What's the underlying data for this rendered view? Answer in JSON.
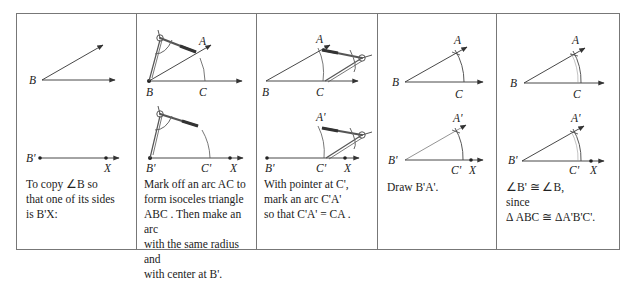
{
  "figure": {
    "panels": [
      {
        "id": "step-1",
        "caption_lines": [
          "To copy ∠B so",
          "that one of its sides",
          "is B'X:"
        ],
        "labels": {
          "B": "B",
          "B_prime": "B'",
          "X": "X"
        }
      },
      {
        "id": "step-2",
        "caption_lines": [
          "Mark off an arc AC to",
          "form isoceles triangle",
          "ABC . Then make an arc",
          "with the same radius and",
          "with center at B'."
        ],
        "labels": {
          "A": "A",
          "B": "B",
          "C": "C",
          "B_prime": "B'",
          "C_prime": "C'",
          "X": "X"
        }
      },
      {
        "id": "step-3",
        "caption_lines": [
          "With pointer at C',",
          "mark an arc C'A'",
          "so that  C'A' = CA ."
        ],
        "labels": {
          "A": "A",
          "B": "B",
          "C": "C",
          "A_prime": "A'",
          "B_prime": "B'",
          "C_prime": "C'",
          "X": "X"
        }
      },
      {
        "id": "step-4",
        "caption_lines": [
          "Draw  B'A'."
        ],
        "labels": {
          "A": "A",
          "B": "B",
          "C": "C",
          "A_prime": "A'",
          "B_prime": "B'",
          "C_prime": "C'",
          "X": "X"
        }
      },
      {
        "id": "step-5",
        "caption_lines": [
          "∠B' ≅ ∠B,",
          "since",
          "Δ ABC  ≅  ΔA'B'C'."
        ],
        "labels": {
          "A": "A",
          "B": "B",
          "C": "C",
          "A_prime": "A'",
          "B_prime": "B'",
          "C_prime": "C'",
          "X": "X"
        }
      }
    ],
    "colors": {
      "line": "#333333",
      "border": "#777777",
      "compass": "#555555",
      "arc": "#555555"
    }
  }
}
